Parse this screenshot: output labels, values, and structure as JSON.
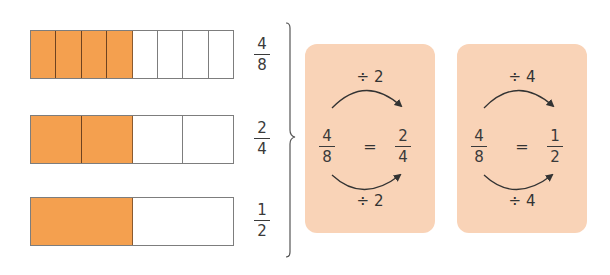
{
  "colors": {
    "filled": "#f4a04f",
    "empty": "#ffffff",
    "card_bg": "#f9d3b7",
    "text": "#333333",
    "border": "#7d7d7d"
  },
  "bars": [
    {
      "segments": 8,
      "filled": 4,
      "fraction": {
        "numerator": "4",
        "denominator": "8"
      }
    },
    {
      "segments": 4,
      "filled": 2,
      "fraction": {
        "numerator": "2",
        "denominator": "4"
      }
    },
    {
      "segments": 2,
      "filled": 1,
      "fraction": {
        "numerator": "1",
        "denominator": "2"
      }
    }
  ],
  "cards": [
    {
      "top_operation": "÷ 2",
      "bottom_operation": "÷ 2",
      "left_fraction": {
        "numerator": "4",
        "denominator": "8"
      },
      "equals": "=",
      "right_fraction": {
        "numerator": "2",
        "denominator": "4"
      }
    },
    {
      "top_operation": "÷ 4",
      "bottom_operation": "÷ 4",
      "left_fraction": {
        "numerator": "4",
        "denominator": "8"
      },
      "equals": "=",
      "right_fraction": {
        "numerator": "1",
        "denominator": "2"
      }
    }
  ]
}
